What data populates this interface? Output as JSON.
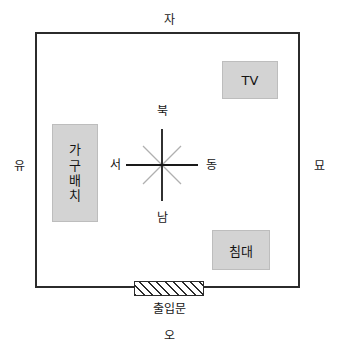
{
  "diagram": {
    "colors": {
      "outline": "#2b2b2b",
      "furniture_fill": "#d3d3d3",
      "compass_primary": "#1a1a1a",
      "compass_secondary": "#b0b0b0",
      "background": "#ffffff"
    }
  },
  "zodiac_markers": {
    "top": "자",
    "bottom": "오",
    "left": "유",
    "right": "묘"
  },
  "compass": {
    "north": "북",
    "south": "남",
    "east": "동",
    "west": "서"
  },
  "furniture": [
    {
      "id": "tv",
      "label": "TV"
    },
    {
      "id": "bed",
      "label": "침대"
    },
    {
      "id": "arrangement",
      "label": "가구배치",
      "chars": [
        "가",
        "구",
        "배",
        "치"
      ]
    }
  ],
  "door": {
    "label": "출입문"
  }
}
